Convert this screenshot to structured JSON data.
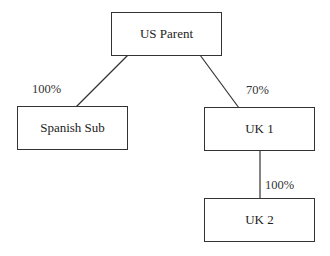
{
  "diagram": {
    "nodes": [
      {
        "id": "us-parent",
        "label": "US Parent"
      },
      {
        "id": "spanish-sub",
        "label": "Spanish Sub"
      },
      {
        "id": "uk1",
        "label": "UK 1"
      },
      {
        "id": "uk2",
        "label": "UK 2"
      }
    ],
    "edges": [
      {
        "from": "US Parent",
        "to": "Spanish Sub",
        "label": "100%"
      },
      {
        "from": "US Parent",
        "to": "UK 1",
        "label": "70%"
      },
      {
        "from": "UK 1",
        "to": "UK 2",
        "label": "100%"
      }
    ]
  }
}
